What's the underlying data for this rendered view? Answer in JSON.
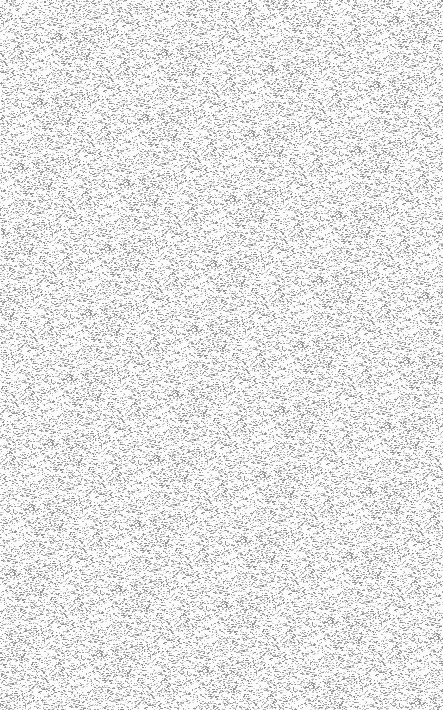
{
  "canvas": {
    "width": 443,
    "height": 710,
    "background": "#fbfbfb",
    "noise": {
      "colors": [
        "#c8c8c8",
        "#b4b4b4",
        "#a0a0a0",
        "#dcdcdc",
        "#8c8c8c"
      ],
      "density": 0.22
    }
  }
}
